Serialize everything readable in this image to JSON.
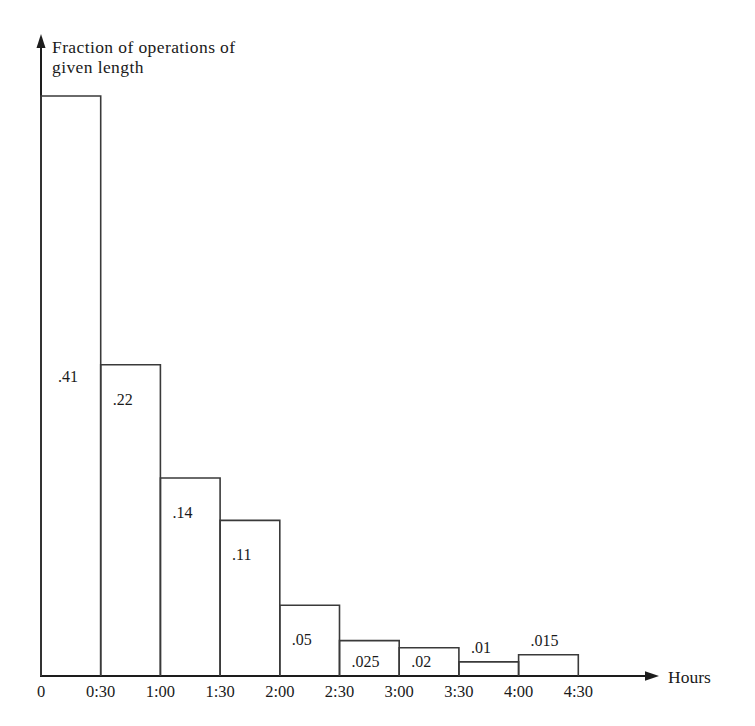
{
  "chart_data": {
    "type": "bar",
    "title": "Fraction of operations of given length",
    "title_line1": "Fraction of operations of",
    "title_line2": "given length",
    "xlabel": "Hours",
    "ylabel": "Fraction of operations of given length",
    "grid": false,
    "legend": null,
    "xlim": [
      0,
      5.0
    ],
    "ylim": [
      0,
      0.41
    ],
    "bin_width_hours": 0.5,
    "categories": [
      "0:00-0:30",
      "0:30-1:00",
      "1:00-1:30",
      "1:30-2:00",
      "2:00-2:30",
      "2:30-3:00",
      "3:00-3:30",
      "3:30-4:00",
      "4:00-4:30"
    ],
    "values": [
      0.41,
      0.22,
      0.14,
      0.11,
      0.05,
      0.025,
      0.02,
      0.01,
      0.015
    ],
    "value_labels": [
      ".41",
      ".22",
      ".14",
      ".11",
      ".05",
      ".025",
      ".02",
      ".01",
      ".015"
    ],
    "label_placement": [
      "inside",
      "inside",
      "inside",
      "inside",
      "inside",
      "inside",
      "inside",
      "above",
      "above"
    ],
    "tick_labels": [
      "0",
      "0:30",
      "1:00",
      "1:30",
      "2:00",
      "2:30",
      "3:00",
      "3:30",
      "4:00",
      "4:30"
    ],
    "axis_color": "#1d1d1d",
    "bar_stroke_color": "#3a3a3a",
    "bar_fill_color": "#ffffff",
    "background_color": "#ffffff"
  },
  "geometry": {
    "origin_x": 41,
    "baseline_y": 676,
    "bin_px": 59.7,
    "y_top_of_max": 96,
    "y_axis_arrow_tip": 36,
    "x_axis_arrow_tip": 657,
    "x_axis_name_x": 668,
    "x_axis_name_y": 683,
    "title_x": 52,
    "title_y1": 53,
    "title_y2": 73,
    "tick_label_y": 697
  }
}
